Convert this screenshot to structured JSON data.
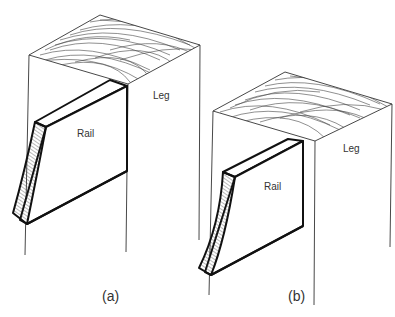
{
  "figure": {
    "panels": [
      {
        "id": "a",
        "caption": "(a)",
        "leg_label": "Leg",
        "rail_label": "Rail"
      },
      {
        "id": "b",
        "caption": "(b)",
        "leg_label": "Leg",
        "rail_label": "Rail"
      }
    ]
  },
  "colors": {
    "line": "#1a1a1a",
    "background": "#ffffff"
  }
}
